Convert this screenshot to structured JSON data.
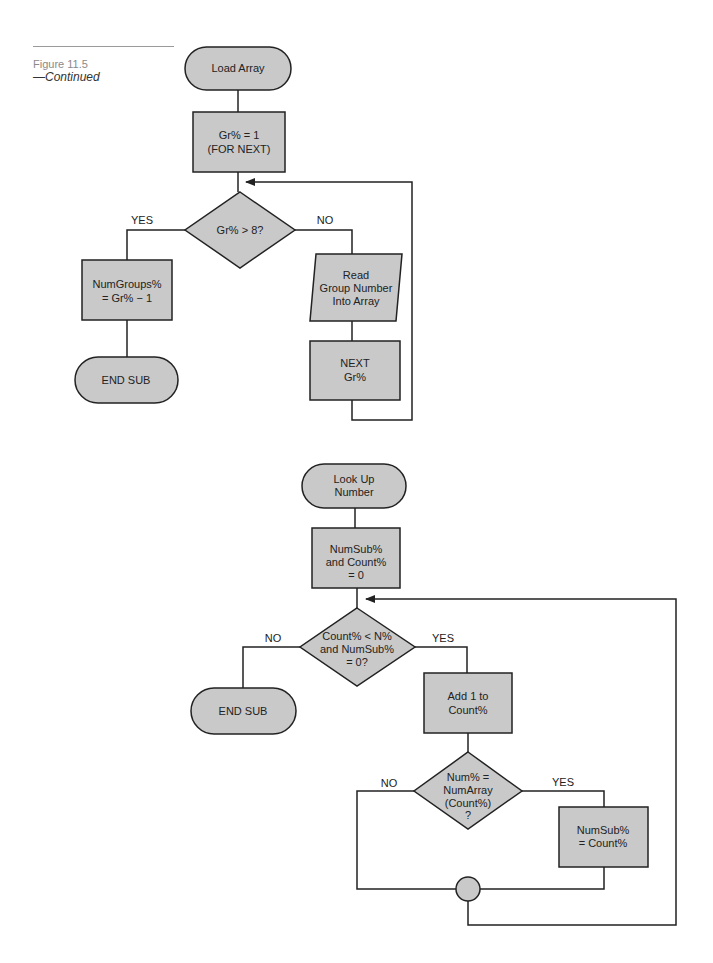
{
  "caption": {
    "figure": "Figure 11.5",
    "subtitle": "—Continued"
  },
  "flowchart_load_array": {
    "start": "Load Array",
    "init": [
      "Gr% = 1",
      "(FOR NEXT)"
    ],
    "decision": "Gr% > 8?",
    "yes_label": "YES",
    "no_label": "NO",
    "yes_process": [
      "NumGroups%",
      "= Gr% − 1"
    ],
    "yes_end": "END SUB",
    "no_input": [
      "Read",
      "Group Number",
      "Into Array"
    ],
    "no_next": [
      "NEXT",
      "Gr%"
    ]
  },
  "flowchart_look_up": {
    "start": [
      "Look Up",
      "Number"
    ],
    "init": [
      "NumSub%",
      "and Count%",
      "= 0"
    ],
    "decision": [
      "Count% < N%",
      "and NumSub%",
      "= 0?"
    ],
    "no_label": "NO",
    "yes_label": "YES",
    "no_end": "END SUB",
    "yes_process": [
      "Add 1 to",
      "Count%"
    ],
    "decision2": [
      "Num% =",
      "NumArray",
      "(Count%)",
      "?"
    ],
    "decision2_no_label": "NO",
    "decision2_yes_label": "YES",
    "decision2_yes_process": [
      "NumSub%",
      "= Count%"
    ]
  },
  "colors": {
    "shape_fill": "#c9c9c9",
    "stroke": "#222222"
  }
}
